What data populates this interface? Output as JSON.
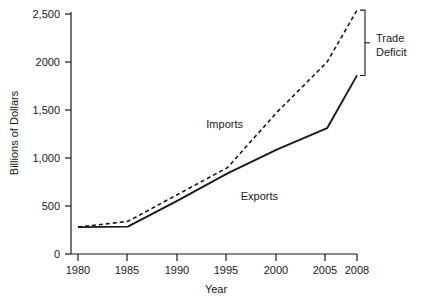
{
  "chart_data": {
    "type": "line",
    "title": "",
    "xlabel": "Year",
    "ylabel": "Billions of Dollars",
    "x": [
      1980,
      1985,
      1990,
      1995,
      2000,
      2005,
      2008
    ],
    "xtick_labels": [
      "1980",
      "1985",
      "1990",
      "1995",
      "2000",
      "2005",
      "2008"
    ],
    "ytick_values": [
      0,
      500,
      1000,
      1500,
      2000,
      2500
    ],
    "ytick_labels": [
      "0",
      "500",
      "1,000",
      "1,500",
      "2000",
      "2,500"
    ],
    "xlim": [
      1980,
      2008
    ],
    "ylim": [
      0,
      2500
    ],
    "grid": false,
    "legend_position": "inline-annotations",
    "series": [
      {
        "name": "Imports",
        "style": "dashed",
        "color": "#1a1a1a",
        "values": [
          280,
          340,
          620,
          900,
          1480,
          2000,
          2540
        ]
      },
      {
        "name": "Exports",
        "style": "solid",
        "color": "#1a1a1a",
        "values": [
          280,
          285,
          555,
          840,
          1090,
          1310,
          1860
        ]
      }
    ],
    "annotations": [
      {
        "text": "Imports",
        "kind": "series-callout",
        "series": "Imports"
      },
      {
        "text": "Exports",
        "kind": "series-callout",
        "series": "Exports"
      },
      {
        "text": "Trade Deficit",
        "kind": "bracket",
        "from_value": 2540,
        "to_value": 1860,
        "at_x": 2008
      }
    ]
  },
  "annotation_text": {
    "trade_deficit_line1": "Trade",
    "trade_deficit_line2": "Deficit"
  }
}
